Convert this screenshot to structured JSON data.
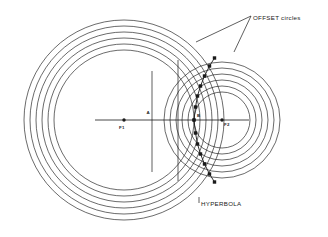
{
  "diagram": {
    "background": "#ffffff",
    "stroke_color": "#1a1a1a",
    "width": 328,
    "height": 237,
    "labels": {
      "offset_circles": "OFFSET circles",
      "hyperbola": "HYPERBOLA",
      "focus_1": "F1",
      "vertex_a": "A",
      "point_b": "B",
      "focus_2": "F2"
    }
  },
  "chart_data": {
    "type": "scatter",
    "xlabel": "",
    "ylabel": "",
    "grid": false,
    "legend": "none",
    "axis_line": {
      "x1": 95,
      "y1": 120,
      "x2": 249,
      "y2": 120
    },
    "foci": [
      {
        "name": "F1",
        "x": 124,
        "y": 120,
        "marker": "dot"
      },
      {
        "name": "F2",
        "x": 222,
        "y": 120,
        "marker": "dot"
      }
    ],
    "named_points": [
      {
        "name": "A",
        "x": 152,
        "y": 120,
        "marker": "none"
      },
      {
        "name": "B",
        "x": 194,
        "y": 120,
        "marker": "dot"
      }
    ],
    "vertical_construction_lines": [
      {
        "x": 152,
        "y1": 71,
        "y2": 172
      },
      {
        "x": 178,
        "y1": 60,
        "y2": 181
      }
    ],
    "circle_family_left": {
      "center_x": 124,
      "center_y": 120,
      "radii": [
        70,
        76,
        82,
        88,
        94,
        100
      ],
      "count": 6
    },
    "circle_family_right": {
      "center_x": 222,
      "center_y": 120,
      "radii": [
        28,
        34,
        40,
        46,
        52,
        58
      ],
      "count": 6
    },
    "hyperbola_vertex": {
      "x": 194,
      "y": 120
    },
    "hyperbola_points_upper": [
      {
        "x": 195.5,
        "y": 107
      },
      {
        "x": 197.5,
        "y": 96
      },
      {
        "x": 200.5,
        "y": 86
      },
      {
        "x": 204.5,
        "y": 76
      },
      {
        "x": 209.5,
        "y": 66
      },
      {
        "x": 214.5,
        "y": 58
      }
    ],
    "hyperbola_points_lower": [
      {
        "x": 195.5,
        "y": 133
      },
      {
        "x": 197.5,
        "y": 144
      },
      {
        "x": 200.5,
        "y": 154
      },
      {
        "x": 204.5,
        "y": 164
      },
      {
        "x": 209.5,
        "y": 174
      },
      {
        "x": 214.5,
        "y": 182
      }
    ],
    "leader_lines": [
      {
        "from_label": "OFFSET circles",
        "x1": 251,
        "y1": 16,
        "x2": 196,
        "y2": 42
      },
      {
        "from_label": "OFFSET circles",
        "x1": 251,
        "y1": 16,
        "x2": 234,
        "y2": 52
      },
      {
        "from_label": "HYPERBOLA",
        "x1": 199,
        "y1": 197,
        "x2": 199,
        "y2": 203
      }
    ]
  }
}
